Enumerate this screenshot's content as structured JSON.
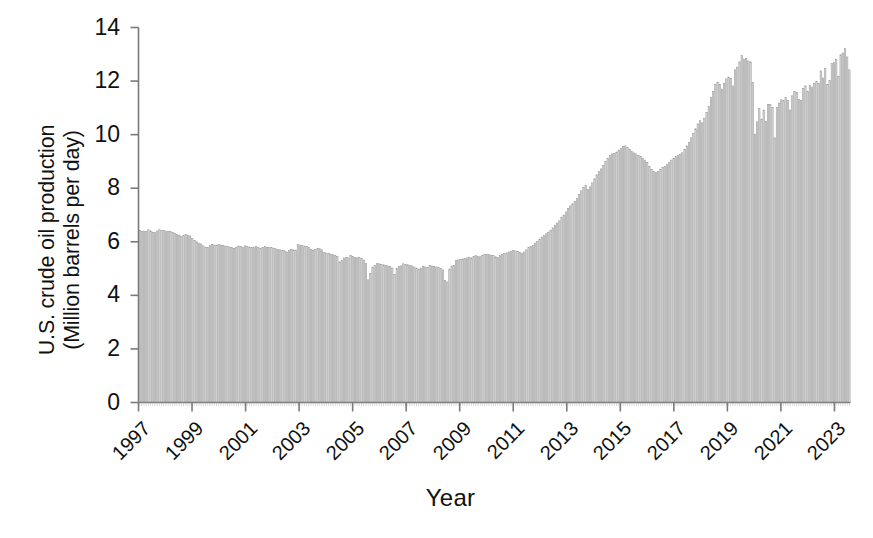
{
  "figure": {
    "background": "#ffffff",
    "axis_color": "#7a7a7a",
    "text_color": "#111111"
  },
  "axes": {
    "xlabel": "Year",
    "ylabel_line1": "U.S. crude oil production",
    "ylabel_line2": "(Million barrels per day)",
    "ytick_labels": [
      "0",
      "2",
      "4",
      "6",
      "8",
      "10",
      "12",
      "14"
    ],
    "xtick_labels": [
      "1997",
      "1999",
      "2001",
      "2003",
      "2005",
      "2007",
      "2009",
      "2011",
      "2013",
      "2015",
      "2017",
      "2019",
      "2021",
      "2023"
    ]
  },
  "chart_data": {
    "type": "bar",
    "title": "",
    "xlabel": "Year",
    "ylabel": "U.S. crude oil production (Million barrels per day)",
    "ylim": [
      0,
      14
    ],
    "ytick_step": 2,
    "xlim": [
      1997.0,
      2023.6
    ],
    "grid": false,
    "legend": null,
    "bar_fill": "#d9d9d9",
    "bar_edge": "#999999",
    "x_tick_years": [
      1997,
      1999,
      2001,
      2003,
      2005,
      2007,
      2009,
      2011,
      2013,
      2015,
      2017,
      2019,
      2021,
      2023
    ],
    "series_name": "U.S. crude oil production",
    "frequency": "monthly",
    "start": "1997-01",
    "units": "million barrels per day",
    "values": [
      6.42,
      6.38,
      6.4,
      6.39,
      6.45,
      6.41,
      6.36,
      6.34,
      6.4,
      6.45,
      6.43,
      6.42,
      6.4,
      6.38,
      6.39,
      6.35,
      6.32,
      6.28,
      6.25,
      6.2,
      6.24,
      6.28,
      6.25,
      6.22,
      6.12,
      6.05,
      6.0,
      5.95,
      5.92,
      5.85,
      5.8,
      5.78,
      5.86,
      5.9,
      5.88,
      5.86,
      5.9,
      5.88,
      5.86,
      5.84,
      5.82,
      5.8,
      5.78,
      5.75,
      5.8,
      5.84,
      5.82,
      5.8,
      5.85,
      5.82,
      5.8,
      5.78,
      5.8,
      5.82,
      5.78,
      5.75,
      5.78,
      5.82,
      5.8,
      5.78,
      5.78,
      5.76,
      5.74,
      5.72,
      5.7,
      5.68,
      5.66,
      5.62,
      5.68,
      5.72,
      5.7,
      5.68,
      5.9,
      5.88,
      5.86,
      5.84,
      5.82,
      5.78,
      5.72,
      5.68,
      5.72,
      5.76,
      5.74,
      5.7,
      5.6,
      5.58,
      5.56,
      5.54,
      5.52,
      5.48,
      5.45,
      5.25,
      5.3,
      5.4,
      5.42,
      5.4,
      5.48,
      5.45,
      5.42,
      5.4,
      5.42,
      5.38,
      5.32,
      5.2,
      4.58,
      4.82,
      5.05,
      5.12,
      5.2,
      5.18,
      5.16,
      5.14,
      5.12,
      5.1,
      5.08,
      5.02,
      4.78,
      5.0,
      5.08,
      5.1,
      5.18,
      5.16,
      5.14,
      5.12,
      5.1,
      5.06,
      5.02,
      4.98,
      5.02,
      5.08,
      5.06,
      5.04,
      5.12,
      5.1,
      5.08,
      5.06,
      5.04,
      5.0,
      4.95,
      4.55,
      4.5,
      4.98,
      5.1,
      5.12,
      5.3,
      5.32,
      5.34,
      5.36,
      5.38,
      5.4,
      5.42,
      5.4,
      5.45,
      5.48,
      5.46,
      5.44,
      5.5,
      5.52,
      5.54,
      5.52,
      5.5,
      5.48,
      5.44,
      5.42,
      5.48,
      5.52,
      5.56,
      5.58,
      5.62,
      5.64,
      5.68,
      5.66,
      5.64,
      5.6,
      5.58,
      5.62,
      5.7,
      5.78,
      5.82,
      5.86,
      5.95,
      6.02,
      6.1,
      6.18,
      6.24,
      6.3,
      6.36,
      6.42,
      6.52,
      6.62,
      6.7,
      6.78,
      6.9,
      7.0,
      7.12,
      7.24,
      7.34,
      7.42,
      7.5,
      7.62,
      7.76,
      7.9,
      8.02,
      8.1,
      7.95,
      8.05,
      8.2,
      8.35,
      8.5,
      8.62,
      8.72,
      8.85,
      9.0,
      9.12,
      9.22,
      9.28,
      9.3,
      9.35,
      9.42,
      9.48,
      9.55,
      9.58,
      9.52,
      9.44,
      9.38,
      9.32,
      9.28,
      9.22,
      9.18,
      9.12,
      9.05,
      8.96,
      8.82,
      8.7,
      8.62,
      8.58,
      8.62,
      8.7,
      8.78,
      8.82,
      8.88,
      8.96,
      9.05,
      9.12,
      9.18,
      9.22,
      9.26,
      9.32,
      9.45,
      9.58,
      9.72,
      9.88,
      10.05,
      10.22,
      10.4,
      10.52,
      10.44,
      10.6,
      10.82,
      11.05,
      11.38,
      11.62,
      11.88,
      11.96,
      11.88,
      11.7,
      11.92,
      12.08,
      12.15,
      12.1,
      11.82,
      12.42,
      12.52,
      12.72,
      12.95,
      12.82,
      12.85,
      12.75,
      12.72,
      11.95,
      10.02,
      10.48,
      10.98,
      10.58,
      10.92,
      10.5,
      11.12,
      11.12,
      11.02,
      9.88,
      11.02,
      11.18,
      11.3,
      11.28,
      11.38,
      11.28,
      10.92,
      11.45,
      11.62,
      11.58,
      11.32,
      11.28,
      11.72,
      11.82,
      11.62,
      11.85,
      11.78,
      11.92,
      11.98,
      11.92,
      12.38,
      12.12,
      12.48,
      11.88,
      12.02,
      12.65,
      12.7,
      12.82,
      12.18,
      12.98,
      13.05,
      13.22,
      12.9,
      12.42
    ]
  }
}
